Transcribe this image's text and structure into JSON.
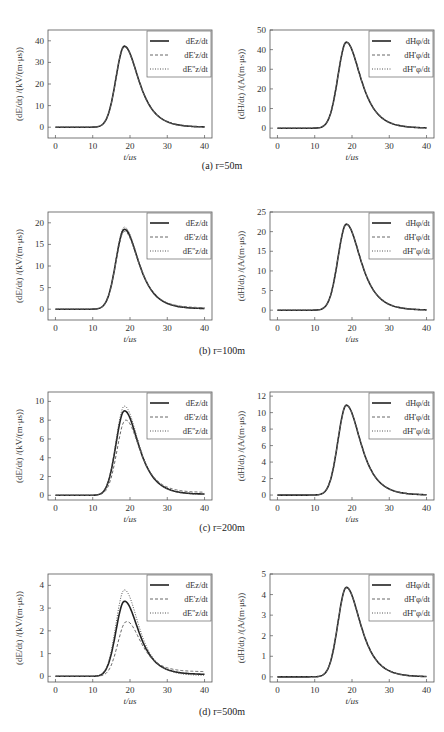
{
  "captions": [
    "(a) r=50m",
    "(b) r=100m",
    "(c) r=200m",
    "(d) r=500m"
  ],
  "chart_data": [
    {
      "id": "a-E",
      "type": "line",
      "row": 0,
      "col": 0,
      "title": "",
      "xlabel": "t/μs",
      "ylabel": "(dE/dt) /(kV/(m·μs))",
      "xlim": [
        -2,
        42
      ],
      "ylim": [
        -5,
        45
      ],
      "xticks": [
        0,
        10,
        20,
        30,
        40
      ],
      "yticks": [
        0,
        10,
        20,
        30,
        40
      ],
      "grid": false,
      "legend_position": "upper right",
      "series": [
        {
          "name": "dEz/dt",
          "style": "solid",
          "peak": 37.5,
          "peak_t": 18.5,
          "tail": 0.0
        },
        {
          "name": "dE'z/dt",
          "style": "dashed",
          "peak": 37.2,
          "peak_t": 18.5,
          "tail": 0.0
        },
        {
          "name": "dE''z/dt",
          "style": "dotted",
          "peak": 37.7,
          "peak_t": 18.5,
          "tail": 0.0
        }
      ]
    },
    {
      "id": "a-H",
      "type": "line",
      "row": 0,
      "col": 1,
      "title": "",
      "xlabel": "t/μs",
      "ylabel": "(dH/dt) /(A/(m·μs))",
      "xlim": [
        -2,
        42
      ],
      "ylim": [
        -5,
        50
      ],
      "xticks": [
        0,
        10,
        20,
        30,
        40
      ],
      "yticks": [
        0,
        10,
        20,
        30,
        40,
        50
      ],
      "grid": false,
      "legend_position": "upper right",
      "series": [
        {
          "name": "dHφ/dt",
          "style": "solid",
          "peak": 43.8,
          "peak_t": 18.5,
          "tail": 0.0
        },
        {
          "name": "dH'φ/dt",
          "style": "dashed",
          "peak": 43.8,
          "peak_t": 18.5,
          "tail": 0.0
        },
        {
          "name": "dH''φ/dt",
          "style": "dotted",
          "peak": 43.8,
          "peak_t": 18.5,
          "tail": 0.0
        }
      ]
    },
    {
      "id": "b-E",
      "type": "line",
      "row": 1,
      "col": 0,
      "title": "",
      "xlabel": "t/μs",
      "ylabel": "(dE/dt) /(kV/(m·μs))",
      "xlim": [
        -2,
        42
      ],
      "ylim": [
        -2.5,
        22.5
      ],
      "xticks": [
        0,
        10,
        20,
        30,
        40
      ],
      "yticks": [
        0,
        5,
        10,
        15,
        20
      ],
      "grid": false,
      "legend_position": "upper right",
      "series": [
        {
          "name": "dEz/dt",
          "style": "solid",
          "peak": 18.5,
          "peak_t": 18.5,
          "tail": 0.1
        },
        {
          "name": "dE'z/dt",
          "style": "dashed",
          "peak": 18.0,
          "peak_t": 18.5,
          "tail": 0.3
        },
        {
          "name": "dE''z/dt",
          "style": "dotted",
          "peak": 19.0,
          "peak_t": 18.5,
          "tail": 0.05
        }
      ]
    },
    {
      "id": "b-H",
      "type": "line",
      "row": 1,
      "col": 1,
      "title": "",
      "xlabel": "t/μs",
      "ylabel": "(dH/dt) /(A/(m·μs))",
      "xlim": [
        -2,
        42
      ],
      "ylim": [
        -2.5,
        25
      ],
      "xticks": [
        0,
        10,
        20,
        30,
        40
      ],
      "yticks": [
        0,
        5,
        10,
        15,
        20,
        25
      ],
      "grid": false,
      "legend_position": "upper right",
      "series": [
        {
          "name": "dHφ/dt",
          "style": "solid",
          "peak": 21.9,
          "peak_t": 18.5,
          "tail": 0.0
        },
        {
          "name": "dH'φ/dt",
          "style": "dashed",
          "peak": 21.9,
          "peak_t": 18.5,
          "tail": 0.0
        },
        {
          "name": "dH''φ/dt",
          "style": "dotted",
          "peak": 21.9,
          "peak_t": 18.5,
          "tail": 0.0
        }
      ]
    },
    {
      "id": "c-E",
      "type": "line",
      "row": 2,
      "col": 0,
      "title": "",
      "xlabel": "t/μs",
      "ylabel": "(dE/dt) /(kV/(m·μs))",
      "xlim": [
        -2,
        42
      ],
      "ylim": [
        -0.5,
        11
      ],
      "xticks": [
        0,
        10,
        20,
        30,
        40
      ],
      "yticks": [
        0,
        2,
        4,
        6,
        8,
        10
      ],
      "grid": false,
      "legend_position": "upper right",
      "series": [
        {
          "name": "dEz/dt",
          "style": "solid",
          "peak": 9.0,
          "peak_t": 18.5,
          "tail": 0.1
        },
        {
          "name": "dE'z/dt",
          "style": "dashed",
          "peak": 8.0,
          "peak_t": 18.8,
          "tail": 0.3
        },
        {
          "name": "dE''z/dt",
          "style": "dotted",
          "peak": 9.5,
          "peak_t": 18.5,
          "tail": 0.05
        }
      ]
    },
    {
      "id": "c-H",
      "type": "line",
      "row": 2,
      "col": 1,
      "title": "",
      "xlabel": "t/μs",
      "ylabel": "(dH/dt) /(A/(m·μs))",
      "xlim": [
        -2,
        42
      ],
      "ylim": [
        -0.6,
        12.5
      ],
      "xticks": [
        0,
        10,
        20,
        30,
        40
      ],
      "yticks": [
        0,
        2,
        4,
        6,
        8,
        10,
        12
      ],
      "grid": false,
      "legend_position": "upper right",
      "series": [
        {
          "name": "dHφ/dt",
          "style": "solid",
          "peak": 10.9,
          "peak_t": 18.5,
          "tail": 0.0
        },
        {
          "name": "dH'φ/dt",
          "style": "dashed",
          "peak": 10.9,
          "peak_t": 18.5,
          "tail": 0.0
        },
        {
          "name": "dH''φ/dt",
          "style": "dotted",
          "peak": 10.9,
          "peak_t": 18.5,
          "tail": 0.0
        }
      ]
    },
    {
      "id": "d-E",
      "type": "line",
      "row": 3,
      "col": 0,
      "title": "",
      "xlabel": "t/μs",
      "ylabel": "(dE/dt) /(kV/(m·μs))",
      "xlim": [
        -2,
        42
      ],
      "ylim": [
        -0.25,
        4.5
      ],
      "xticks": [
        0,
        10,
        20,
        30,
        40
      ],
      "yticks": [
        0,
        1,
        2,
        3,
        4
      ],
      "grid": false,
      "legend_position": "upper right",
      "series": [
        {
          "name": "dEz/dt",
          "style": "solid",
          "peak": 3.3,
          "peak_t": 18.5,
          "tail": 0.08
        },
        {
          "name": "dE'z/dt",
          "style": "dashed",
          "peak": 2.4,
          "peak_t": 19.0,
          "tail": 0.2
        },
        {
          "name": "dE''z/dt",
          "style": "dotted",
          "peak": 3.8,
          "peak_t": 18.5,
          "tail": 0.03
        }
      ]
    },
    {
      "id": "d-H",
      "type": "line",
      "row": 3,
      "col": 1,
      "title": "",
      "xlabel": "t/μs",
      "ylabel": "(dH/dt) /(A/(m·μs))",
      "xlim": [
        -2,
        42
      ],
      "ylim": [
        -0.25,
        5
      ],
      "xticks": [
        0,
        10,
        20,
        30,
        40
      ],
      "yticks": [
        0,
        1,
        2,
        3,
        4,
        5
      ],
      "grid": false,
      "legend_position": "upper right",
      "series": [
        {
          "name": "dHφ/dt",
          "style": "solid",
          "peak": 4.35,
          "peak_t": 18.5,
          "tail": 0.0
        },
        {
          "name": "dH'φ/dt",
          "style": "dashed",
          "peak": 4.35,
          "peak_t": 18.5,
          "tail": 0.0
        },
        {
          "name": "dH''φ/dt",
          "style": "dotted",
          "peak": 4.35,
          "peak_t": 18.5,
          "tail": 0.0
        }
      ]
    }
  ]
}
